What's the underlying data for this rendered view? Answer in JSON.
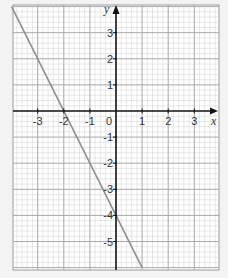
{
  "chart_data": {
    "type": "line",
    "title": "",
    "xlabel": "x",
    "ylabel": "y",
    "xlim": [
      -4,
      4
    ],
    "ylim": [
      -6,
      4
    ],
    "grid": true,
    "minor_divisions_per_unit": 5,
    "x_ticks": [
      -3,
      -2,
      -1,
      0,
      1,
      2,
      3
    ],
    "x_tick_labels": [
      "-3",
      "-2",
      "-1",
      "0",
      "1",
      "2",
      "3"
    ],
    "y_ticks": [
      3,
      2,
      1,
      -1,
      -2,
      -3,
      -4,
      -5
    ],
    "y_tick_labels": [
      "3",
      "2",
      "1",
      "-1",
      "-2",
      "-3",
      "-4",
      "-5"
    ],
    "series": [
      {
        "name": "y = -2x - 4",
        "equation": "y = -2x - 4",
        "x": [
          -4,
          -3,
          -2,
          -1,
          0,
          1
        ],
        "y": [
          4,
          2,
          0,
          -2,
          -4,
          -6
        ],
        "color": "#8a8a8a"
      }
    ],
    "legend": null
  },
  "style": {
    "background": "#f3f3f3",
    "paper": "#ffffff",
    "minor_grid": "#d9d9d9",
    "major_grid": "#a8a8a8",
    "axis": "#111111",
    "line": "#8f8f8f",
    "label": "#333333"
  }
}
